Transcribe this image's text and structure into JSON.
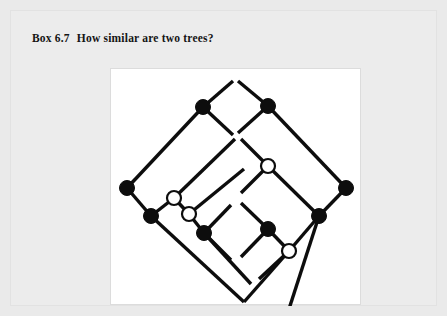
{
  "page": {
    "background_color": "#eaeaea",
    "card_color": "#ececec"
  },
  "title": {
    "label": "Box 6.7",
    "text": "How similar are two trees?",
    "full": "Box 6.7  How similar are two trees?"
  },
  "figure": {
    "name": "two-trees-comparison-diagram",
    "panel_color": "#ffffff",
    "stroke_color": "#0d0d0d",
    "filled_node_color": "#0d0d0d",
    "open_node_color": "#ffffff",
    "width": 251,
    "height": 237,
    "trees": [
      {
        "id": "left-tree",
        "edges": [
          [
            16,
            119,
            92,
            38
          ],
          [
            92,
            38,
            122,
            12
          ],
          [
            92,
            38,
            122,
            66
          ],
          [
            16,
            119,
            40,
            147
          ],
          [
            40,
            147,
            63,
            129
          ],
          [
            63,
            129,
            78,
            145
          ],
          [
            78,
            145,
            93,
            164
          ],
          [
            93,
            164,
            120,
            136
          ],
          [
            93,
            164,
            120,
            191
          ],
          [
            63,
            129,
            124,
            70
          ],
          [
            78,
            145,
            133,
            100
          ],
          [
            40,
            147,
            133,
            233
          ],
          [
            93,
            164,
            140,
            215
          ]
        ],
        "nodes": [
          {
            "x": 16,
            "y": 119,
            "type": "filled"
          },
          {
            "x": 92,
            "y": 38,
            "type": "filled"
          },
          {
            "x": 40,
            "y": 147,
            "type": "filled"
          },
          {
            "x": 63,
            "y": 129,
            "type": "open"
          },
          {
            "x": 78,
            "y": 145,
            "type": "open"
          },
          {
            "x": 93,
            "y": 164,
            "type": "filled"
          }
        ]
      },
      {
        "id": "right-tree",
        "edges": [
          [
            235,
            119,
            157,
            37
          ],
          [
            157,
            37,
            127,
            12
          ],
          [
            157,
            37,
            127,
            64
          ],
          [
            235,
            119,
            208,
            147
          ],
          [
            208,
            147,
            178,
            240
          ],
          [
            208,
            147,
            157,
            97
          ],
          [
            157,
            97,
            130,
            70
          ],
          [
            157,
            97,
            130,
            124
          ],
          [
            208,
            147,
            178,
            182
          ],
          [
            178,
            182,
            148,
            210
          ],
          [
            178,
            182,
            157,
            160
          ],
          [
            157,
            160,
            130,
            134
          ],
          [
            157,
            160,
            130,
            188
          ],
          [
            178,
            182,
            133,
            233
          ]
        ],
        "nodes": [
          {
            "x": 235,
            "y": 119,
            "type": "filled"
          },
          {
            "x": 157,
            "y": 37,
            "type": "filled"
          },
          {
            "x": 208,
            "y": 147,
            "type": "filled"
          },
          {
            "x": 157,
            "y": 97,
            "type": "open"
          },
          {
            "x": 157,
            "y": 160,
            "type": "filled"
          },
          {
            "x": 178,
            "y": 182,
            "type": "open"
          }
        ]
      }
    ],
    "node_radius_filled": 7.5,
    "node_radius_open": 7
  }
}
